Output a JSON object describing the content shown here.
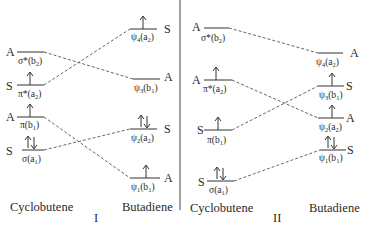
{
  "diagrams": [
    {
      "id": "I",
      "roman": "I",
      "left_label": "Cyclobutene",
      "right_label": "Butadiene",
      "left_levels": [
        {
          "name": "σ*",
          "sub_open": "(b",
          "sub": "2",
          "close": ")",
          "sym": "A",
          "y": 52,
          "electrons": ""
        },
        {
          "name": "π*",
          "sub_open": "(a",
          "sub": "2",
          "close": ")",
          "sym": "S",
          "y": 85,
          "electrons": "up"
        },
        {
          "name": "π",
          "sub_open": "(b",
          "sub": "1",
          "close": ")",
          "sym": "A",
          "y": 117,
          "electrons": "up"
        },
        {
          "name": "σ",
          "sub_open": "(a",
          "sub": "1",
          "close": ")",
          "sym": "S",
          "y": 150,
          "electrons": "updown"
        }
      ],
      "right_levels": [
        {
          "name": "ψ",
          "idx": "4",
          "sub_open": "(a",
          "sub": "2",
          "close": ")",
          "sym": "S",
          "y": 29,
          "electrons": "up"
        },
        {
          "name": "ψ",
          "idx": "3",
          "sub_open": "(b",
          "sub": "1",
          "close": ")",
          "sym": "A",
          "y": 79,
          "electrons": ""
        },
        {
          "name": "ψ",
          "idx": "2",
          "sub_open": "(a",
          "sub": "2",
          "close": ")",
          "sym": "S",
          "y": 129,
          "electrons": "updown"
        },
        {
          "name": "ψ",
          "idx": "1",
          "sub_open": "(b",
          "sub": "1",
          "close": ")",
          "sym": "A",
          "y": 178,
          "electrons": "up"
        }
      ],
      "correlations": [
        [
          "σ*(b2)",
          "ψ3(b1)"
        ],
        [
          "π*(a2)",
          "ψ4(a2)"
        ],
        [
          "π(b1)",
          "ψ1(b1)"
        ],
        [
          "σ(a1)",
          "ψ2(a2)"
        ]
      ]
    },
    {
      "id": "II",
      "roman": "II",
      "left_label": "Cyclobutene",
      "right_label": "Butadiene",
      "left_levels": [
        {
          "name": "σ*",
          "sub_open": "(b",
          "sub": "2",
          "close": ")",
          "sym": "A",
          "y": 28,
          "electrons": ""
        },
        {
          "name": "π*",
          "sub_open": "(a",
          "sub": "2",
          "close": ")",
          "sym": "A",
          "y": 80,
          "electrons": "up"
        },
        {
          "name": "π",
          "sub_open": "(b",
          "sub": "1",
          "close": ")",
          "sym": "S",
          "y": 130,
          "electrons": "up"
        },
        {
          "name": "σ",
          "sub_open": "(a",
          "sub": "1",
          "close": ")",
          "sym": "S",
          "y": 181,
          "electrons": "updown"
        }
      ],
      "right_levels": [
        {
          "name": "ψ",
          "idx": "4",
          "sub_open": "(a",
          "sub": "2",
          "close": ")",
          "sym": "A",
          "y": 53,
          "electrons": ""
        },
        {
          "name": "ψ",
          "idx": "3",
          "sub_open": "(b",
          "sub": "1",
          "close": ")",
          "sym": "S",
          "y": 86,
          "electrons": "up"
        },
        {
          "name": "ψ",
          "idx": "2",
          "sub_open": "(a",
          "sub": "2",
          "close": ")",
          "sym": "A",
          "y": 118,
          "electrons": "up"
        },
        {
          "name": "ψ",
          "idx": "1",
          "sub_open": "(b",
          "sub": "1",
          "close": ")",
          "sym": "S",
          "y": 150,
          "electrons": "updown"
        }
      ],
      "correlations": [
        [
          "σ*(b2)",
          "ψ4(a2)"
        ],
        [
          "π*(a2)",
          "ψ2(a2)"
        ],
        [
          "π(b1)",
          "ψ3(b1)"
        ],
        [
          "σ(a1)",
          "ψ1(b1)"
        ]
      ]
    }
  ]
}
